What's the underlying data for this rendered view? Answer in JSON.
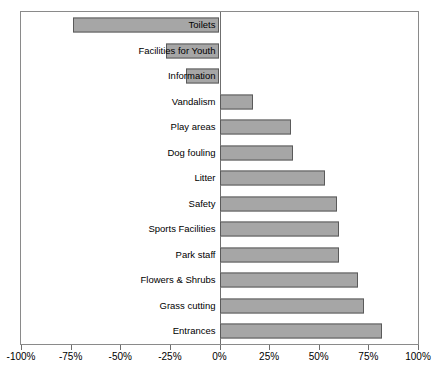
{
  "chart_data": {
    "type": "bar",
    "orientation": "horizontal",
    "title": "",
    "xlabel": "",
    "ylabel": "",
    "xlim": [
      -100,
      100
    ],
    "xtick_values": [
      -100,
      -75,
      -50,
      -25,
      0,
      25,
      50,
      75,
      100
    ],
    "xtick_labels": [
      "-100%",
      "-75%",
      "-50%",
      "-25%",
      "0%",
      "25%",
      "50%",
      "75%",
      "100%"
    ],
    "grid": false,
    "legend": null,
    "bar_color": "#a6a6a6",
    "bar_border_color": "#5a5a5a",
    "axis_color": "#6f6f6f",
    "categories": [
      "Toilets",
      "Facilities for Youth",
      "Information",
      "Vandalism",
      "Play areas",
      "Dog fouling",
      "Litter",
      "Safety",
      "Sports Facilities",
      "Park staff",
      "Flowers & Shrubs",
      "Grass cutting",
      "Entrances"
    ],
    "values": [
      -74,
      -27,
      -17,
      17,
      36,
      37,
      53,
      59,
      60,
      60,
      70,
      73,
      82
    ],
    "value_labels": [
      "-74%",
      "-27%",
      "-17%",
      "17%",
      "36%",
      "37%",
      "53%",
      "59%",
      "60%",
      "60%",
      "70%",
      "73%",
      "82%"
    ]
  }
}
